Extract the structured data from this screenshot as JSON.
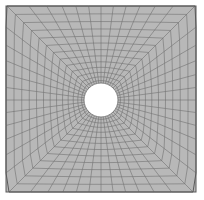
{
  "figure": {
    "type": "fem-mesh-diagram",
    "background_color": "#ffffff",
    "canvas": {
      "width": 204,
      "height": 200
    }
  },
  "plate": {
    "name": "square-plate",
    "shape": "square",
    "x": 6,
    "y": 6,
    "width": 190,
    "height": 186,
    "fill_color": "#b8b8b8",
    "border_color": "#5a5a5a",
    "border_width": 1
  },
  "hole": {
    "name": "central-circular-hole",
    "shape": "circle",
    "center_x": 101,
    "center_y": 100,
    "radius": 17,
    "fill_color": "#ffffff",
    "edge_color": "#6a6a6a"
  },
  "mesh": {
    "topology": "structured-polar-to-square transition",
    "radial_rings": 13,
    "angular_divisions": 48,
    "line_color": "#6a6a6a",
    "line_width": 0.55,
    "outer_line_color": "#5a5a5a",
    "fill_color": "#b8b8b8",
    "ring_spacing": "graded, finer near hole",
    "grading_exponent": 1.35
  },
  "chart_data": {
    "type": "mesh",
    "elements": 624,
    "nodes": 672,
    "rings": 13,
    "sectors": 48,
    "hole_radius": 17,
    "plate_half_width": 95,
    "plate_half_height": 93
  }
}
